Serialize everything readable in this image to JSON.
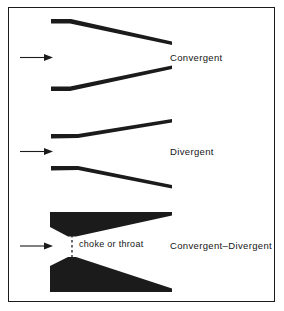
{
  "figure": {
    "title_present": false,
    "background_color": "#ffffff",
    "ink_color": "#1b1b1b",
    "frame": {
      "name": "figure-border",
      "visible": true,
      "color": "#1b1b1b"
    }
  },
  "labels": {
    "convergent": "Convergent",
    "divergent": "Divergent",
    "convergent_divergent": "Convergent–Divergent",
    "choke_or_throat": "choke or throat"
  },
  "diagrams": [
    {
      "id": "convergent-nozzle",
      "label": "Convergent",
      "description": "Duct walls start parallel then taper inward toward the exit",
      "flow_arrow": {
        "present": true,
        "direction": "right"
      }
    },
    {
      "id": "divergent-nozzle",
      "label": "Divergent",
      "description": "Duct walls start parallel then flare outward toward the exit",
      "flow_arrow": {
        "present": true,
        "direction": "right"
      }
    },
    {
      "id": "convergent-divergent-nozzle",
      "label": "Convergent–Divergent",
      "description": "Solid wedge walls converge to a minimum area then diverge",
      "throat_annotation": "choke or throat",
      "throat_marker": "dashed-vertical-line",
      "flow_arrow": {
        "present": true,
        "direction": "right"
      }
    }
  ],
  "colors": {
    "ink": "#1b1b1b",
    "paper": "#ffffff",
    "text": "#151515"
  }
}
